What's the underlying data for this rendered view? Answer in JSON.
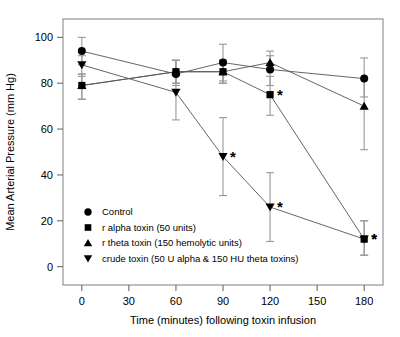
{
  "chart_data": {
    "type": "line",
    "title": "",
    "xlabel": "Time (minutes) following toxin infusion",
    "ylabel": "Mean Arterial Pressure (mm Hg)",
    "x": [
      0,
      60,
      90,
      120,
      180
    ],
    "xticks": [
      0,
      30,
      60,
      90,
      120,
      150,
      180
    ],
    "yticks": [
      0,
      20,
      40,
      60,
      80,
      100
    ],
    "xlim": [
      -12,
      192
    ],
    "ylim": [
      -8,
      108
    ],
    "grid": false,
    "legend_position": "lower-left-inside",
    "error_bars": "mean +/- SEM",
    "significance_marker": "*",
    "series": [
      {
        "name": "Control",
        "marker": "circle",
        "values": [
          94,
          84,
          89,
          86,
          82
        ],
        "err_low": [
          6,
          5,
          8,
          7,
          8
        ],
        "err_high": [
          6,
          6,
          8,
          8,
          9
        ],
        "significant": [
          false,
          false,
          false,
          false,
          false
        ]
      },
      {
        "name": "r alpha toxin (50 units)",
        "marker": "square",
        "values": [
          79,
          85,
          85,
          75,
          12
        ],
        "err_low": [
          6,
          5,
          5,
          9,
          7
        ],
        "err_high": [
          5,
          5,
          5,
          8,
          8
        ],
        "significant": [
          false,
          false,
          false,
          true,
          true
        ]
      },
      {
        "name": "r theta toxin (150 hemolytic units)",
        "marker": "triangle-up",
        "values": [
          79,
          85,
          85,
          89,
          70
        ],
        "err_low": [
          6,
          5,
          5,
          3,
          19
        ],
        "err_high": [
          5,
          5,
          5,
          3,
          12
        ],
        "significant": [
          false,
          false,
          false,
          false,
          false
        ]
      },
      {
        "name": "crude toxin (50 U alpha & 150 HU theta toxins)",
        "marker": "triangle-down",
        "values": [
          88,
          76,
          48,
          26,
          12
        ],
        "err_low": [
          5,
          12,
          17,
          15,
          7
        ],
        "err_high": [
          4,
          9,
          17,
          15,
          8
        ],
        "significant": [
          false,
          false,
          true,
          true,
          true
        ]
      }
    ]
  },
  "legend": {
    "items": [
      {
        "marker": "circle",
        "label": "Control"
      },
      {
        "marker": "square",
        "label": "r alpha toxin (50 units)"
      },
      {
        "marker": "triangle-up",
        "label": "r theta toxin (150 hemolytic units)"
      },
      {
        "marker": "triangle-down",
        "label": "crude toxin (50 U alpha & 150 HU theta toxins)"
      }
    ]
  },
  "axes": {
    "x_title": "Time (minutes) following toxin infusion",
    "y_title": "Mean Arterial Pressure (mm Hg)",
    "x_tick_labels": [
      "0",
      "30",
      "60",
      "90",
      "120",
      "150",
      "180"
    ],
    "y_tick_labels": [
      "0",
      "20",
      "40",
      "60",
      "80",
      "100"
    ]
  },
  "colors": {
    "marker": "#000000",
    "line": "#555555",
    "error_bar": "#999999",
    "frame": "#8a8a8a",
    "background": "#ffffff"
  }
}
